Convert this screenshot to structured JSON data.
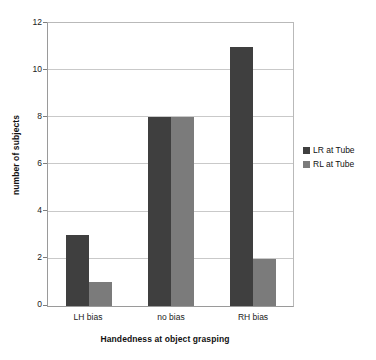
{
  "chart_data": {
    "type": "bar",
    "title": "",
    "subtitle": "",
    "xlabel": "Handedness at object grasping",
    "ylabel": "number of subjects",
    "categories": [
      "LH bias",
      "no bias",
      "RH bias"
    ],
    "series": [
      {
        "name": "LR at Tube",
        "values": [
          3,
          8,
          11
        ],
        "color": "#3f3f3f"
      },
      {
        "name": "RL at Tube",
        "values": [
          1,
          8,
          2
        ],
        "color": "#7b7b7b"
      }
    ],
    "ylim": [
      0,
      12
    ],
    "yticks": [
      0,
      2,
      4,
      6,
      8,
      10,
      12
    ],
    "ytick_labels": [
      "0",
      "2",
      "4",
      "6",
      "8",
      "10",
      "12"
    ],
    "grid": true,
    "grid_axis": "y",
    "legend_position": "right",
    "bar_gap": 0,
    "group_gap": true
  },
  "legend": {
    "items": [
      {
        "label": "LR at Tube",
        "color": "#3f3f3f"
      },
      {
        "label": "RL at Tube",
        "color": "#7b7b7b"
      }
    ]
  },
  "axes": {
    "y_title": "number of subjects",
    "x_title": "Handedness at object grasping",
    "y_tick_labels": [
      "12",
      "10",
      "8",
      "6",
      "4",
      "2",
      "0"
    ],
    "x_tick_labels": [
      "LH bias",
      "no bias",
      "RH bias"
    ]
  },
  "colors": {
    "series_1": "#3f3f3f",
    "series_2": "#7b7b7b",
    "gridline": "#c9c9c9",
    "axis": "#9a9a9a",
    "background": "#ffffff"
  }
}
